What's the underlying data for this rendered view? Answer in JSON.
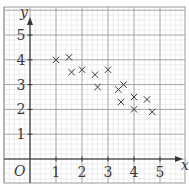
{
  "chart_data": {
    "type": "scatter",
    "title": "",
    "xlabel": "x",
    "ylabel": "y",
    "origin_label": "O",
    "xlim": [
      0,
      5.8
    ],
    "ylim": [
      0,
      5.8
    ],
    "x_ticks": [
      1,
      2,
      3,
      4,
      5
    ],
    "y_ticks": [
      1,
      2,
      3,
      4,
      5
    ],
    "x_tick_labels": [
      "1",
      "2",
      "3",
      "4",
      "5"
    ],
    "y_tick_labels": [
      "1",
      "2",
      "3",
      "4",
      "5"
    ],
    "grid": true,
    "grid_minor_per_unit": 5,
    "marker": "x",
    "legend": null,
    "points": [
      {
        "x": 1.0,
        "y": 4.0
      },
      {
        "x": 1.5,
        "y": 4.1
      },
      {
        "x": 1.6,
        "y": 3.5
      },
      {
        "x": 2.0,
        "y": 3.6
      },
      {
        "x": 2.5,
        "y": 3.4
      },
      {
        "x": 2.6,
        "y": 2.9
      },
      {
        "x": 3.0,
        "y": 3.6
      },
      {
        "x": 3.4,
        "y": 2.8
      },
      {
        "x": 3.6,
        "y": 3.0
      },
      {
        "x": 3.5,
        "y": 2.3
      },
      {
        "x": 4.0,
        "y": 2.5
      },
      {
        "x": 4.5,
        "y": 2.4
      },
      {
        "x": 4.0,
        "y": 2.0
      },
      {
        "x": 4.7,
        "y": 1.9
      }
    ]
  },
  "colors": {
    "background": "#ffffff",
    "major_grid": "#9a9a9a",
    "minor_grid": "#e2e2e2",
    "axis": "#333333",
    "marker": "#3a3a3a",
    "text": "#3a3a3a"
  }
}
